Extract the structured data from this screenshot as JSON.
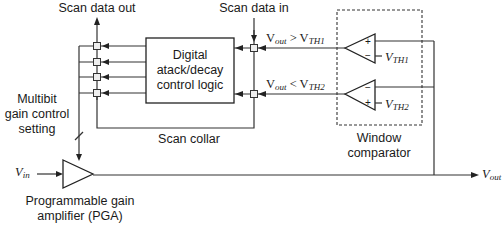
{
  "diagram": {
    "labels": {
      "scan_data_out": "Scan data out",
      "scan_data_in": "Scan data in",
      "logic_line1": "Digital",
      "logic_line2": "atack/decay",
      "logic_line3": "control logic",
      "cond1_v": "V",
      "cond1_out": "out",
      "cond1_op": " > V",
      "cond1_th": "TH1",
      "cond2_v": "V",
      "cond2_out": "out",
      "cond2_op": " < V",
      "cond2_th": "TH2",
      "vth1_v": "V",
      "vth1_sub": "TH1",
      "vth2_v": "V",
      "vth2_sub": "TH2",
      "multibit_line1": "Multibit",
      "multibit_line2": "gain control",
      "multibit_line3": "setting",
      "scan_collar": "Scan collar",
      "window_line1": "Window",
      "window_line2": "comparator",
      "vin_v": "V",
      "vin_sub": "in",
      "vout_v": "V",
      "vout_sub": "out",
      "pga_line1": "Programmable gain",
      "pga_line2": "amplifier (PGA)"
    },
    "comparator_signs": {
      "top_plus": "+",
      "top_minus": "−",
      "bottom_minus": "−",
      "bottom_plus": "+"
    }
  }
}
